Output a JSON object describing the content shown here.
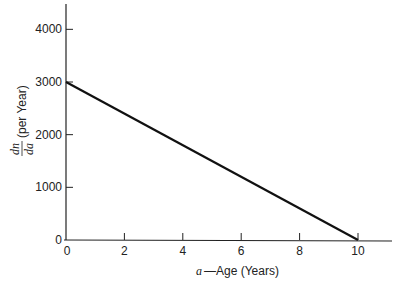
{
  "chart_data": {
    "type": "line",
    "title": "",
    "xlabel": "a—Age (Years)",
    "xlabel_var": "a",
    "xlabel_text": "—Age (Years)",
    "ylabel": "dn/da (per Year)",
    "ylabel_num": "dn",
    "ylabel_den": "da",
    "ylabel_text": "(per Year)",
    "xlim": [
      0,
      11
    ],
    "ylim": [
      0,
      4400
    ],
    "xticks": [
      0,
      2,
      4,
      6,
      8,
      10
    ],
    "yticks": [
      0,
      1000,
      2000,
      3000,
      4000
    ],
    "grid": false,
    "legend": "none",
    "series": [
      {
        "name": "dn/da",
        "x": [
          0,
          10
        ],
        "y": [
          3000,
          0
        ],
        "color": "#111111"
      }
    ]
  }
}
